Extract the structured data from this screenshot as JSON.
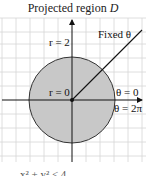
{
  "title": {
    "text": "Projected region ",
    "symbol": "D"
  },
  "diagram": {
    "center": {
      "x": 72,
      "y": 100
    },
    "radius_px": 43,
    "grid_spacing_px": 14,
    "fill_color": "#c8c8c8",
    "grid_color": "#d6d6d6",
    "labels": {
      "r_outer": "r = 2",
      "r_center": "r = 0",
      "ray": "Fixed θ",
      "theta_start": "θ = 0",
      "theta_end": "θ = 2π"
    }
  },
  "footer": {
    "partial_text": "x² + y² ≤ 4"
  }
}
